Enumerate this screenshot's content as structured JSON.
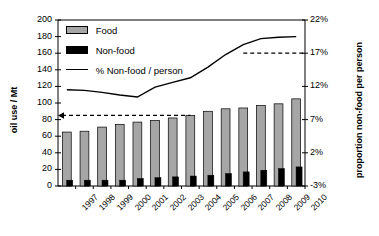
{
  "chart_data": {
    "type": "bar",
    "title": "",
    "subtitle": "",
    "xlabel": "",
    "ylabel": "oil use / Mt",
    "ylabel_secondary": "proportion non-food per person",
    "categories": [
      "1997",
      "1998",
      "1999",
      "2000",
      "2001",
      "2002",
      "2003",
      "2004",
      "2005",
      "2006",
      "2007",
      "2008",
      "2009",
      "2010"
    ],
    "ylim": [
      0,
      200
    ],
    "yticks": [
      0,
      20,
      40,
      60,
      80,
      100,
      120,
      140,
      160,
      180,
      200
    ],
    "ylim_secondary": [
      -3,
      22
    ],
    "yticks_secondary": [
      "-3%",
      "2%",
      "7%",
      "12%",
      "17%",
      "22%"
    ],
    "grid": false,
    "legend_position": "upper-left",
    "series": [
      {
        "name": "Food",
        "type": "bar",
        "axis": "left",
        "color": "#a6a6a6",
        "values": [
          65,
          66,
          71,
          74,
          77,
          79,
          82,
          85,
          90,
          93,
          94,
          97,
          99,
          105
        ]
      },
      {
        "name": "Non-food",
        "type": "bar",
        "axis": "left",
        "color": "#000000",
        "values": [
          7,
          7,
          7,
          7,
          9,
          10,
          11,
          12,
          13,
          15,
          17,
          19,
          21,
          23
        ]
      },
      {
        "name": "% Non-food / person",
        "type": "line",
        "axis": "right",
        "color": "#000000",
        "values": [
          11.5,
          11.4,
          11.1,
          10.7,
          10.4,
          11.9,
          12.6,
          13.3,
          14.9,
          16.8,
          18.3,
          19.2,
          19.4,
          19.5
        ]
      }
    ],
    "annotations": [
      {
        "name": "non-food-person-reference",
        "type": "dashed-horizontal",
        "axis": "right",
        "value": 17.0,
        "arrow": "none",
        "from_x_category": "2007",
        "to_x_category": "axis-right"
      },
      {
        "name": "oil-use-reference",
        "type": "dashed-horizontal",
        "axis": "left",
        "value": 85,
        "arrow": "left",
        "from_x_category": "axis-left",
        "to_x_category": "2004"
      }
    ]
  },
  "legend": {
    "items": [
      {
        "label": "Food",
        "marker": "filled-square",
        "color": "#a6a6a6"
      },
      {
        "label": "Non-food",
        "marker": "filled-square",
        "color": "#000000"
      },
      {
        "label": "% Non-food / person",
        "marker": "line",
        "color": "#000000"
      }
    ]
  },
  "axes": {
    "left": {
      "title": "oil use / Mt",
      "labels": [
        "200",
        "180",
        "160",
        "140",
        "120",
        "100",
        "80",
        "60",
        "40",
        "20",
        "0"
      ]
    },
    "right": {
      "title": "proportion non-food per person",
      "labels": [
        "22%",
        "17%",
        "12%",
        "7%",
        "2%",
        "-3%"
      ]
    },
    "bottom": {
      "labels": [
        "1997",
        "1998",
        "1999",
        "2000",
        "2001",
        "2002",
        "2003",
        "2004",
        "2005",
        "2006",
        "2007",
        "2008",
        "2009",
        "2010"
      ]
    }
  }
}
